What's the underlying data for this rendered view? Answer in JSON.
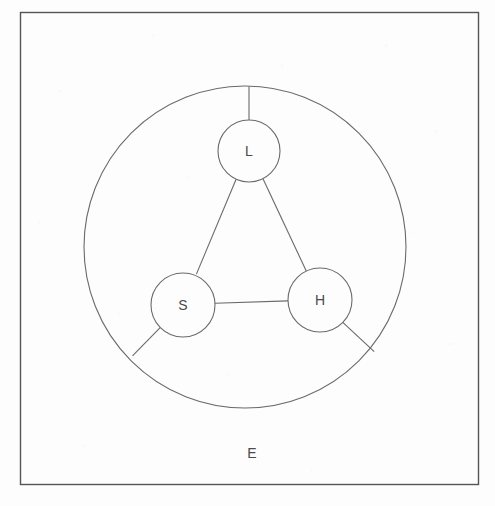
{
  "figure": {
    "credit": "E. Edwards",
    "stroke_color": "#555555",
    "label_color": "#4a4a4a",
    "background_color": "#fdfdfd",
    "frame": {
      "name": "figure-border",
      "x": 20,
      "y": 12,
      "width": 458,
      "height": 472
    },
    "outer_circle": {
      "label": "E",
      "label_x": 252,
      "label_y": 453,
      "cx": 245,
      "cy": 247,
      "r": 161
    },
    "nodes": [
      {
        "id": "L",
        "label": "L",
        "cx": 249,
        "cy": 151,
        "r": 31
      },
      {
        "id": "S",
        "label": "S",
        "cx": 183,
        "cy": 305,
        "r": 32
      },
      {
        "id": "H",
        "label": "H",
        "cx": 320,
        "cy": 300,
        "r": 32
      }
    ],
    "edges": [
      {
        "name": "edge-L-S",
        "from": "L",
        "to": "S"
      },
      {
        "name": "edge-L-H",
        "from": "L",
        "to": "H"
      },
      {
        "name": "edge-S-H",
        "from": "S",
        "to": "H"
      }
    ],
    "spokes": [
      {
        "name": "spoke-L-top",
        "from": "L",
        "angle_deg": -90
      },
      {
        "name": "spoke-S-lower-left",
        "from": "S",
        "angle_deg": 150
      },
      {
        "name": "spoke-H-lower-right",
        "from": "H",
        "angle_deg": 30
      }
    ]
  }
}
